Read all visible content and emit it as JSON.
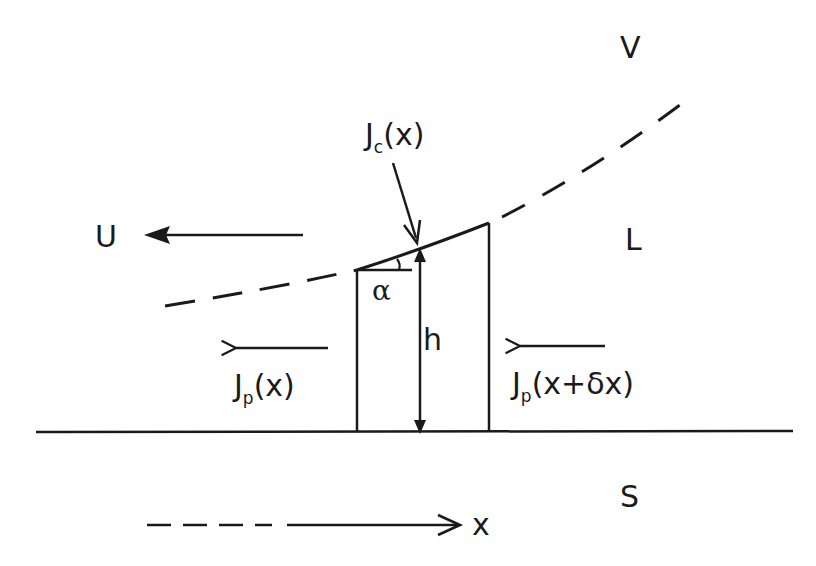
{
  "diagram": {
    "type": "physics-schematic",
    "regions": {
      "vapor": "V",
      "liquid": "L",
      "solid": "S"
    },
    "labels": {
      "velocity": "U",
      "condensation_flux_main": "J",
      "condensation_flux_sub": "c",
      "condensation_flux_arg": "(x)",
      "flux_left_main": "J",
      "flux_left_sub": "p",
      "flux_left_arg": "(x)",
      "flux_right_main": "J",
      "flux_right_sub": "p",
      "flux_right_arg": "(x+δx)",
      "height": "h",
      "angle": "α",
      "axis": "x"
    },
    "colors": {
      "ink": "#1a1a1a",
      "background": "#ffffff"
    },
    "elements": [
      {
        "id": "substrate-line",
        "kind": "solid line"
      },
      {
        "id": "interface-curve",
        "kind": "dashed curve, solid over control volume"
      },
      {
        "id": "control-volume",
        "kind": "trapezoid with sloped top"
      },
      {
        "id": "height-arrow",
        "kind": "double-headed arrow",
        "label": "h"
      },
      {
        "id": "angle-marker",
        "kind": "angle arc",
        "label": "α"
      },
      {
        "id": "velocity-arrow",
        "kind": "filled arrow pointing left",
        "label": "U"
      },
      {
        "id": "flux-left-arrow",
        "kind": "open arrow pointing left",
        "label": "Jp(x)"
      },
      {
        "id": "flux-right-arrow",
        "kind": "open arrow pointing left",
        "label": "Jp(x+δx)"
      },
      {
        "id": "condensation-arrow",
        "kind": "arrow pointing down to interface",
        "label": "Jc(x)"
      },
      {
        "id": "x-axis-arrow",
        "kind": "dashed then solid arrow pointing right",
        "label": "x"
      }
    ]
  }
}
